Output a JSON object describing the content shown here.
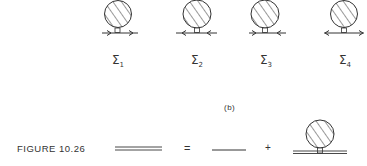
{
  "part_a": {
    "diagrams": [
      {
        "symbol": "Σ",
        "subscript": "1",
        "arrows": "right-right"
      },
      {
        "symbol": "Σ",
        "subscript": "2",
        "arrows": "left-left"
      },
      {
        "symbol": "Σ",
        "subscript": "3",
        "arrows": "in-in"
      },
      {
        "symbol": "Σ",
        "subscript": "4",
        "arrows": "out-out"
      }
    ]
  },
  "part_label": "(b)",
  "figure_caption": "FIGURE 10.26",
  "equation": {
    "equals": "=",
    "plus": "+"
  },
  "colors": {
    "ink": "#333333",
    "background": "#ffffff"
  }
}
